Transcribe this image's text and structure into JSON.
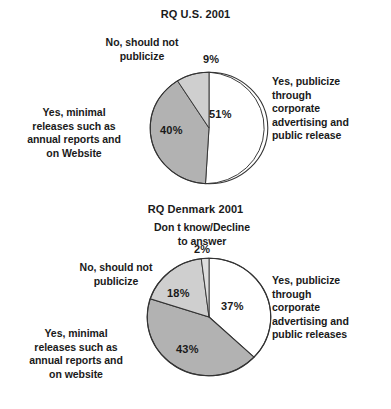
{
  "figure": {
    "background": "#ffffff",
    "text_color": "#1a1a1a"
  },
  "palette": {
    "white": "#ffffff",
    "medium_gray": "#b2b2b2",
    "light_gray": "#cfcfcf",
    "lighter_gray": "#dedede",
    "outline": "#333333"
  },
  "charts": {
    "us": {
      "title": "RQ U.S. 2001",
      "labels": {
        "no_publicize": "No, should not\npublicize",
        "minimal_releases": "Yes, minimal\nreleases such as\nannual reports and\non Website",
        "yes_publicize": "Yes, publicize\nthrough\ncorporate\nadvertising and\npublic release"
      },
      "percents": {
        "yes_publicize": "51%",
        "minimal_releases": "40%",
        "no_publicize": "9%"
      }
    },
    "dk": {
      "title": "RQ Denmark 2001",
      "labels": {
        "dont_know": "Don t know/Decline\nto answer",
        "no_publicize": "No, should not\npublicize",
        "minimal_releases": "Yes, minimal\nreleases such as\nannual reports and\non website",
        "yes_publicize": "Yes, publicize\nthrough\ncorporate\nadvertising and\npublic releases"
      },
      "percents": {
        "yes_publicize": "37%",
        "minimal_releases": "43%",
        "no_publicize": "18%",
        "dont_know": "2%"
      }
    }
  },
  "chart_data": [
    {
      "type": "pie",
      "title": "RQ U.S. 2001",
      "labels": [
        "Yes, publicize through corporate advertising and public release",
        "Yes, minimal releases such as annual reports and on Website",
        "No, should not publicize"
      ],
      "values": [
        51,
        40,
        9
      ],
      "value_labels": [
        "51%",
        "40%",
        "9%"
      ],
      "colors": [
        "#ffffff",
        "#b2b2b2",
        "#cfcfcf"
      ],
      "start_angle_deg": 0,
      "direction": "clockwise",
      "units": "percent",
      "legend": "callout-labels",
      "grid": false
    },
    {
      "type": "pie",
      "title": "RQ Denmark 2001",
      "labels": [
        "Yes, publicize through corporate advertising and public releases",
        "Yes, minimal releases such as annual reports and on website",
        "No, should not publicize",
        "Don t know/Decline to answer"
      ],
      "values": [
        37,
        43,
        18,
        2
      ],
      "value_labels": [
        "37%",
        "43%",
        "18%",
        "2%"
      ],
      "colors": [
        "#ffffff",
        "#b2b2b2",
        "#cfcfcf",
        "#dedede"
      ],
      "start_angle_deg": 0,
      "direction": "clockwise",
      "units": "percent",
      "legend": "callout-labels",
      "grid": false
    }
  ]
}
